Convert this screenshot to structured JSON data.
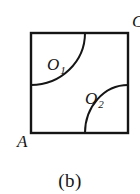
{
  "figure": {
    "caption": "(b)",
    "square": {
      "x": 31,
      "y": 33,
      "width": 97,
      "height": 100,
      "stroke_color": "#151515",
      "stroke_width": 2.4
    },
    "regions": [
      {
        "id": "O1",
        "label_main": "O",
        "label_sub": "1",
        "position": "upper-left",
        "label_x": 47,
        "label_y": 70,
        "arc": {
          "description": "quarter-arc concave toward top-left corner",
          "start_x": 85,
          "start_y": 33,
          "end_x": 31,
          "end_y": 85,
          "radius_x": 54,
          "radius_y": 52,
          "sweep": 1
        }
      },
      {
        "id": "O2",
        "label_main": "O",
        "label_sub": "2",
        "position": "lower-right",
        "label_x": 85,
        "label_y": 104,
        "arc": {
          "description": "quarter-arc concave toward bottom-right corner",
          "start_x": 128,
          "start_y": 85,
          "end_x": 85,
          "end_y": 133,
          "radius_x": 43,
          "radius_y": 48,
          "sweep": 0
        }
      }
    ],
    "corner_labels": [
      {
        "id": "A",
        "text": "A",
        "corner": "bottom-left",
        "x": 17,
        "y": 147
      },
      {
        "id": "C",
        "text": "C",
        "corner": "top-right",
        "x": 132,
        "y": 27,
        "clipped": true
      }
    ],
    "colors": {
      "ink": "#151515",
      "background": "#ffffff"
    }
  }
}
